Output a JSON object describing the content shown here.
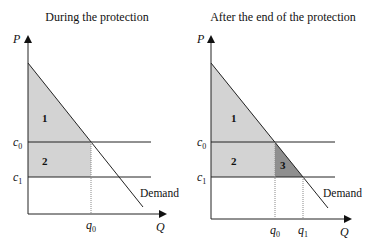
{
  "panels": [
    {
      "title": "During the protection",
      "y_axis_label": "P",
      "x_axis_label": "Q",
      "price_labels": [
        {
          "base": "c",
          "sub": "0"
        },
        {
          "base": "c",
          "sub": "1"
        }
      ],
      "quantity_labels": [
        {
          "base": "q",
          "sub": "0"
        }
      ],
      "areas": [
        "1",
        "2"
      ],
      "curve_label": "Demand"
    },
    {
      "title": "After the end of the protection",
      "y_axis_label": "P",
      "x_axis_label": "Q",
      "price_labels": [
        {
          "base": "c",
          "sub": "0"
        },
        {
          "base": "c",
          "sub": "1"
        }
      ],
      "quantity_labels": [
        {
          "base": "q",
          "sub": "0"
        },
        {
          "base": "q",
          "sub": "1"
        }
      ],
      "areas": [
        "1",
        "2",
        "3"
      ],
      "curve_label": "Demand"
    }
  ],
  "colors": {
    "light_area": "#d3d3d3",
    "dark_area": "#8f8f8f",
    "line": "#222222"
  }
}
